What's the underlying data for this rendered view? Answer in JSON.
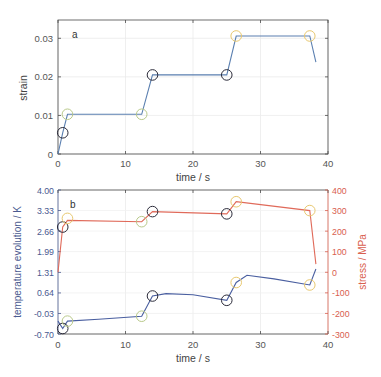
{
  "chart_data": [
    {
      "type": "line",
      "panel_label": "a",
      "xlabel": "time / s",
      "ylabel": "strain",
      "xlim": [
        0,
        40
      ],
      "ylim": [
        0,
        0.0335
      ],
      "xticks": [
        "0",
        "10",
        "20",
        "30",
        "40"
      ],
      "yticks": [
        "0",
        "0.01",
        "0.02",
        "0.03"
      ],
      "grid": true,
      "series": [
        {
          "name": "strain",
          "color": "#5a7fb0",
          "x": [
            0,
            0.7,
            1.4,
            12.4,
            14.0,
            25.0,
            26.4,
            37.3,
            38.2
          ],
          "y": [
            0,
            0.0055,
            0.0103,
            0.0103,
            0.0205,
            0.0205,
            0.0306,
            0.0306,
            0.0238
          ]
        }
      ],
      "markers": [
        {
          "x": 0.7,
          "y": 0.0055,
          "color": "#2b2b3a"
        },
        {
          "x": 1.4,
          "y": 0.0103,
          "color": "#b9c98a"
        },
        {
          "x": 12.4,
          "y": 0.0103,
          "color": "#b9c98a"
        },
        {
          "x": 14.0,
          "y": 0.0205,
          "color": "#2b2b3a"
        },
        {
          "x": 25.0,
          "y": 0.0205,
          "color": "#2b2b3a"
        },
        {
          "x": 26.4,
          "y": 0.0306,
          "color": "#e8c870"
        },
        {
          "x": 37.3,
          "y": 0.0306,
          "color": "#e8c870"
        }
      ]
    },
    {
      "type": "line",
      "panel_label": "b",
      "xlabel": "time / s",
      "ylabel": "temperature evolution / K",
      "ylabel_right": "stress / MPa",
      "xlim": [
        0,
        40
      ],
      "ylim": [
        -0.7,
        4.0
      ],
      "ylim_right": [
        -300,
        400
      ],
      "xticks": [
        "0",
        "10",
        "20",
        "30",
        "40"
      ],
      "yticks": [
        "-0.70",
        "-0.03",
        "0.64",
        "1.31",
        "1.99",
        "2.66",
        "3.33",
        "4.00"
      ],
      "yticks_right": [
        "-300",
        "-200",
        "-100",
        "0",
        "100",
        "200",
        "300",
        "400"
      ],
      "grid": true,
      "series": [
        {
          "name": "temperature evolution",
          "axis": "left",
          "color": "#4a5fa0",
          "x": [
            0,
            0.7,
            1.4,
            6,
            12.4,
            14.0,
            16,
            20,
            25.0,
            26.4,
            28,
            32,
            37.3,
            38.2
          ],
          "y": [
            -0.28,
            -0.52,
            -0.28,
            -0.22,
            -0.12,
            0.54,
            0.62,
            0.58,
            0.4,
            0.98,
            1.22,
            1.1,
            0.9,
            1.42
          ]
        },
        {
          "name": "stress",
          "axis": "right",
          "color": "#e06a5a",
          "x": [
            0,
            0.7,
            1.4,
            12.4,
            14.0,
            25.0,
            26.4,
            37.3,
            38.2
          ],
          "y": [
            0,
            220,
            252,
            246,
            295,
            284,
            343,
            300,
            40
          ]
        }
      ],
      "markers": [
        {
          "x": 0.7,
          "y_right": 220,
          "color": "#2b2b3a"
        },
        {
          "x": 1.4,
          "y_right": 262,
          "color": "#e8c870"
        },
        {
          "x": 12.4,
          "y_right": 246,
          "color": "#b9c98a"
        },
        {
          "x": 14.0,
          "y_right": 295,
          "color": "#2b2b3a"
        },
        {
          "x": 25.0,
          "y_right": 284,
          "color": "#2b2b3a"
        },
        {
          "x": 26.4,
          "y_right": 343,
          "color": "#e8c870"
        },
        {
          "x": 37.3,
          "y_right": 300,
          "color": "#e8c870"
        },
        {
          "x": 0.7,
          "y": -0.52,
          "color": "#2b2b3a"
        },
        {
          "x": 1.4,
          "y": -0.28,
          "color": "#b9c98a"
        },
        {
          "x": 12.4,
          "y": -0.12,
          "color": "#b9c98a"
        },
        {
          "x": 14.0,
          "y": 0.54,
          "color": "#2b2b3a"
        },
        {
          "x": 25.0,
          "y": 0.4,
          "color": "#2b2b3a"
        },
        {
          "x": 26.4,
          "y": 0.98,
          "color": "#e8c870"
        },
        {
          "x": 37.3,
          "y": 0.9,
          "color": "#e8c870"
        }
      ]
    }
  ]
}
